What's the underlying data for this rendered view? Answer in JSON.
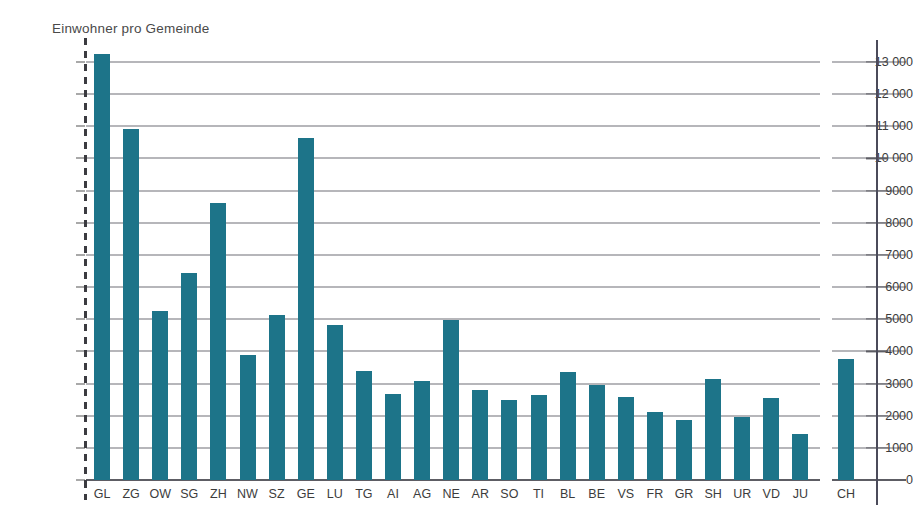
{
  "chart_data": {
    "type": "bar",
    "title": "Einwohner pro Gemeinde",
    "xlabel": "",
    "ylabel": "Einwohner pro Gemeinde",
    "ylim": [
      0,
      13500
    ],
    "ytick_values": [
      0,
      1000,
      2000,
      3000,
      4000,
      5000,
      6000,
      7000,
      8000,
      9000,
      10000,
      11000,
      12000,
      13000
    ],
    "ytick_labels": [
      "0",
      "1000",
      "2000",
      "3000",
      "4000",
      "5000",
      "6000",
      "7000",
      "8000",
      "9000",
      "10 000",
      "11 000",
      "12 000",
      "13 000"
    ],
    "grid": true,
    "legend": "none",
    "bar_color": "#1d7489",
    "categories": [
      "GL",
      "ZG",
      "OW",
      "SG",
      "ZH",
      "NW",
      "SZ",
      "GE",
      "LU",
      "TG",
      "AI",
      "AG",
      "NE",
      "AR",
      "SO",
      "TI",
      "BL",
      "BE",
      "VS",
      "FR",
      "GR",
      "SH",
      "UR",
      "VD",
      "JU"
    ],
    "values": [
      13250,
      10920,
      5270,
      6430,
      8630,
      3880,
      5140,
      10640,
      4820,
      3380,
      2690,
      3080,
      4980,
      2790,
      2480,
      2650,
      3370,
      2950,
      2590,
      2130,
      1880,
      3150,
      1960,
      2560,
      1420
    ],
    "total_category": "CH",
    "total_value": 3750,
    "series": [
      {
        "name": "Einwohner pro Gemeinde",
        "points": [
          {
            "label": "GL",
            "value": 13250
          },
          {
            "label": "ZG",
            "value": 10920
          },
          {
            "label": "OW",
            "value": 5270
          },
          {
            "label": "SG",
            "value": 6430
          },
          {
            "label": "ZH",
            "value": 8630
          },
          {
            "label": "NW",
            "value": 3880
          },
          {
            "label": "SZ",
            "value": 5140
          },
          {
            "label": "GE",
            "value": 10640
          },
          {
            "label": "LU",
            "value": 4820
          },
          {
            "label": "TG",
            "value": 3380
          },
          {
            "label": "AI",
            "value": 2690
          },
          {
            "label": "AG",
            "value": 3080
          },
          {
            "label": "NE",
            "value": 4980
          },
          {
            "label": "AR",
            "value": 2790
          },
          {
            "label": "SO",
            "value": 2480
          },
          {
            "label": "TI",
            "value": 2650
          },
          {
            "label": "BL",
            "value": 3370
          },
          {
            "label": "BE",
            "value": 2950
          },
          {
            "label": "VS",
            "value": 2590
          },
          {
            "label": "FR",
            "value": 2130
          },
          {
            "label": "GR",
            "value": 1880
          },
          {
            "label": "SH",
            "value": 3150
          },
          {
            "label": "UR",
            "value": 1960
          },
          {
            "label": "VD",
            "value": 2560
          },
          {
            "label": "JU",
            "value": 1420
          },
          {
            "label": "CH",
            "value": 3750
          }
        ]
      }
    ]
  },
  "colors": {
    "bar": "#1d7489",
    "gridline": "#6f6f76",
    "axis": "#4b4b5a",
    "text": "#3c3c3c"
  }
}
